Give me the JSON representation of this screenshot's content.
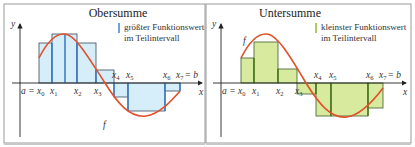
{
  "panels": [
    {
      "title": "Obersumme",
      "legend": {
        "line1": "größter Funktionswert",
        "line2": "im Teilintervall",
        "marker_color": "#4a8fd0"
      },
      "fill_color": "#d6eefa",
      "marker_color": "#3f7fc4",
      "function_label": "f",
      "axis_labels": {
        "x": "x",
        "y": "y"
      },
      "tick_labels": {
        "a_eq": "a = x",
        "x0": "0",
        "x1": "1",
        "x2": "2",
        "x3": "3",
        "x4": "4",
        "x5": "5",
        "x6": "6",
        "x7": "7",
        "b_eq": "= b"
      }
    },
    {
      "title": "Untersumme",
      "legend": {
        "line1": "kleinster Funktionswert",
        "line2": "im Teilintervall",
        "marker_color": "#9bbf3a"
      },
      "fill_color": "#d7ea9e",
      "marker_color": "#4f7a24",
      "function_label": "f",
      "axis_labels": {
        "x": "x",
        "y": "y"
      },
      "tick_labels": {
        "a_eq": "a = x",
        "x0": "0",
        "x1": "1",
        "x2": "2",
        "x3": "3",
        "x4": "4",
        "x5": "5",
        "x6": "6",
        "x7": "7",
        "b_eq": "= b"
      }
    }
  ],
  "curve_color": "#e0502a",
  "frame_color": "#8a8a8a"
}
